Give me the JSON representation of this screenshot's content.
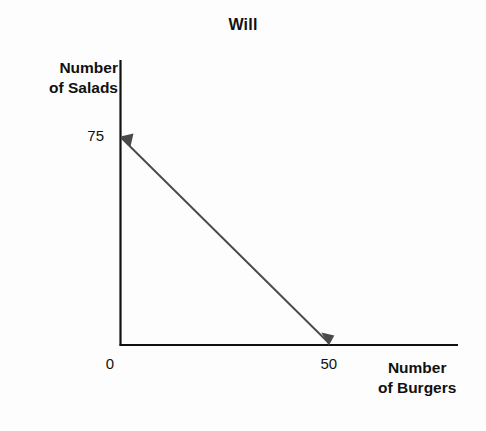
{
  "chart_data": {
    "type": "line",
    "title": "Will",
    "xlabel": "Number of Burgers",
    "ylabel": "Number of Salads",
    "xlabel_lines": [
      "Number",
      "of Burgers"
    ],
    "ylabel_lines": [
      "Number",
      "of Salads"
    ],
    "x": [
      0,
      50
    ],
    "values": [
      75,
      0
    ],
    "series": [
      {
        "name": "Production Possibilities Frontier",
        "x": [
          0,
          50
        ],
        "values": [
          75,
          0
        ]
      }
    ],
    "xlim": [
      0,
      81
    ],
    "ylim": [
      0,
      103
    ],
    "x_tick_labels": [
      "0",
      "50"
    ],
    "x_tick_values": [
      0,
      50
    ],
    "y_tick_labels": [
      "75"
    ],
    "y_tick_values": [
      75
    ],
    "grid": false,
    "legend": null,
    "line_color": "#4a4a4a",
    "axis_color": "#111111",
    "background_color": "#fdfdfd",
    "annotations": [
      {
        "label": "y-intercept arrow",
        "x": 0,
        "y": 75,
        "direction": "left"
      },
      {
        "label": "x-intercept arrow",
        "x": 50,
        "y": 0,
        "direction": "down"
      }
    ]
  }
}
